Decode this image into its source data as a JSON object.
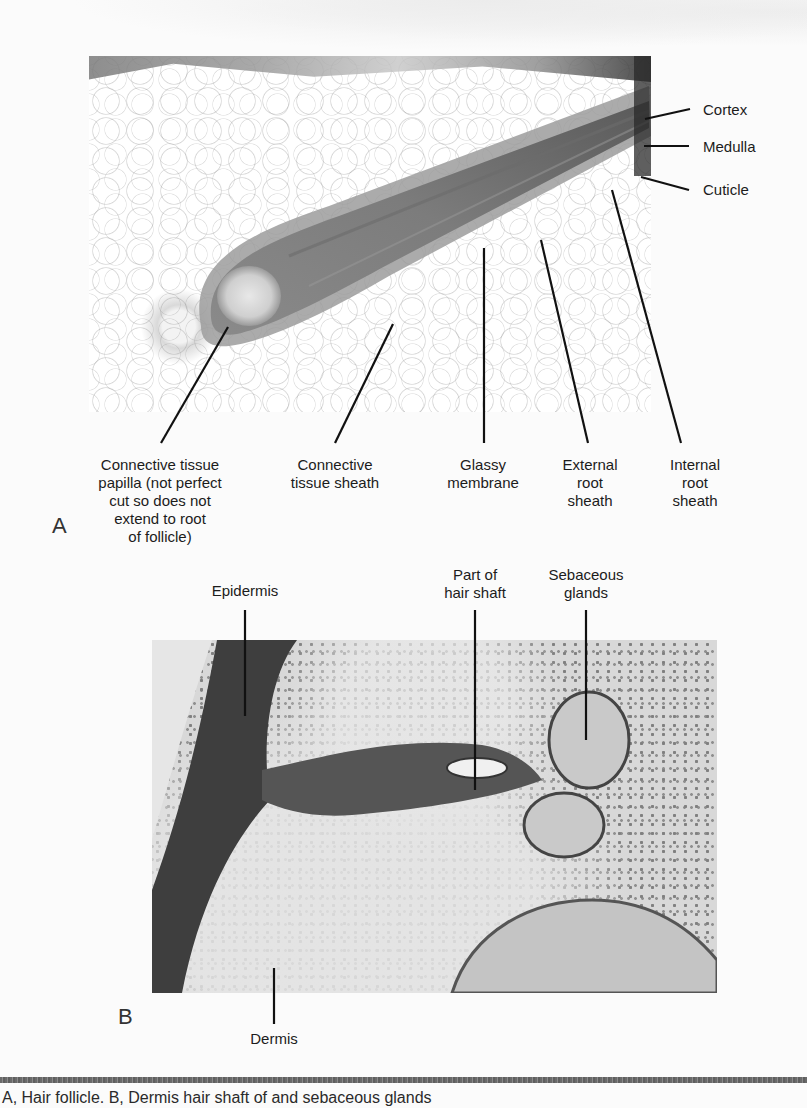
{
  "figure": {
    "panel_a": {
      "letter": "A",
      "labels_right": [
        {
          "id": "cortex",
          "text": "Cortex"
        },
        {
          "id": "medulla",
          "text": "Medulla"
        },
        {
          "id": "cuticle",
          "text": "Cuticle"
        }
      ],
      "labels_bottom": [
        {
          "id": "connective-tissue-papilla",
          "text": "Connective tissue\npapilla (not perfect\ncut so does not\nextend to root\nof follicle)"
        },
        {
          "id": "connective-tissue-sheath",
          "text": "Connective\ntissue sheath"
        },
        {
          "id": "glassy-membrane",
          "text": "Glassy\nmembrane"
        },
        {
          "id": "external-root-sheath",
          "text": "External\nroot\nsheath"
        },
        {
          "id": "internal-root-sheath",
          "text": "Internal\nroot\nsheath"
        }
      ]
    },
    "panel_b": {
      "letter": "B",
      "labels_top": [
        {
          "id": "epidermis",
          "text": "Epidermis"
        },
        {
          "id": "part-of-hair-shaft",
          "text": "Part of\nhair shaft"
        },
        {
          "id": "sebaceous-glands",
          "text": "Sebaceous\nglands"
        }
      ],
      "labels_bottom": [
        {
          "id": "dermis",
          "text": "Dermis"
        }
      ]
    },
    "caption": "A, Hair follicle. B, Dermis hair shaft of and sebaceous glands"
  }
}
